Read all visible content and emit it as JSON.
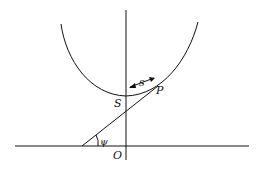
{
  "diagram": {
    "labels": {
      "S": "S",
      "P": "P",
      "s": "s",
      "psi": "ψ",
      "O": "O"
    },
    "stroke_color": "#111111",
    "background": "#ffffff"
  }
}
